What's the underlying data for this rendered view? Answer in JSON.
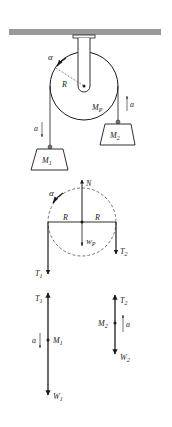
{
  "diagram": {
    "colors": {
      "ink": "#1a1a1a",
      "ceiling": "#9a9a9a",
      "dashed": "#555555"
    },
    "system": {
      "pulley_label": "M",
      "pulley_sub": "P",
      "radius_label": "R",
      "angular_accel_label": "α",
      "mass1_label": "M",
      "mass1_sub": "1",
      "mass2_label": "M",
      "mass2_sub": "2",
      "accel_label_left": "a",
      "accel_label_right": "a"
    },
    "pulley_fbd": {
      "normal_label": "N",
      "alpha_label": "α",
      "radius_left_label": "R",
      "radius_right_label": "R",
      "weight_label": "W",
      "weight_sub": "P",
      "tension1_label": "T",
      "tension1_sub": "1",
      "tension2_label": "T",
      "tension2_sub": "2"
    },
    "mass1_fbd": {
      "tension_label": "T",
      "tension_sub": "1",
      "mass_label": "M",
      "mass_sub": "1",
      "accel_label": "a",
      "weight_label": "W",
      "weight_sub": "1"
    },
    "mass2_fbd": {
      "tension_label": "T",
      "tension_sub": "2",
      "mass_label": "M",
      "mass_sub": "2",
      "accel_label": "a",
      "weight_label": "W",
      "weight_sub": "2"
    }
  }
}
